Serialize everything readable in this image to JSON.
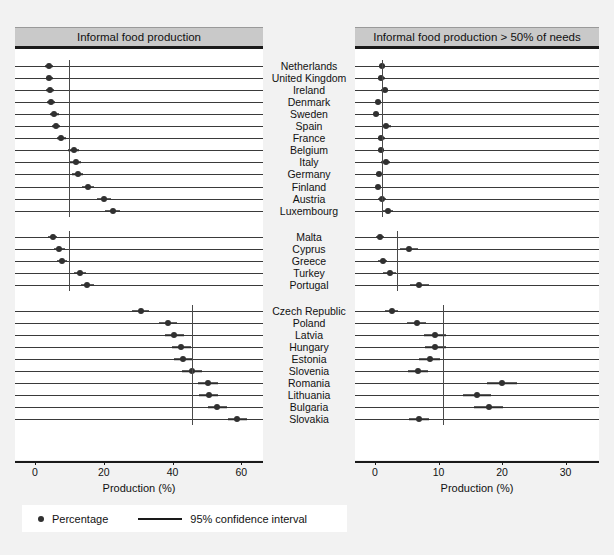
{
  "legend": {
    "percentage_label": "Percentage",
    "ci_label": "95% confidence interval",
    "dot_icon": "filled-circle-marker",
    "line_icon": "horizontal-line-marker"
  },
  "chart_data": {
    "type": "scatter",
    "title": "",
    "panels": [
      {
        "id": "left",
        "header": "Informal food production",
        "xlabel": "Production (%)",
        "xlim": [
          0,
          64
        ],
        "ticks": [
          0,
          20,
          40,
          60
        ],
        "tick_labels": [
          "0",
          "20",
          "40",
          "60"
        ],
        "grid": false,
        "groups": [
          {
            "name": "Western Europe",
            "reference_line": 10.0,
            "points": [
              {
                "label": "Netherlands",
                "value": 4.1,
                "ci_low": 3.0,
                "ci_high": 5.2
              },
              {
                "label": "United Kingdom",
                "value": 4.2,
                "ci_low": 3.1,
                "ci_high": 5.3
              },
              {
                "label": "Ireland",
                "value": 4.4,
                "ci_low": 3.2,
                "ci_high": 5.6
              },
              {
                "label": "Denmark",
                "value": 4.6,
                "ci_low": 3.4,
                "ci_high": 5.8
              },
              {
                "label": "Sweden",
                "value": 5.6,
                "ci_low": 4.3,
                "ci_high": 6.9
              },
              {
                "label": "Spain",
                "value": 6.1,
                "ci_low": 4.8,
                "ci_high": 7.4
              },
              {
                "label": "France",
                "value": 7.6,
                "ci_low": 6.3,
                "ci_high": 8.9
              },
              {
                "label": "Belgium",
                "value": 11.2,
                "ci_low": 9.6,
                "ci_high": 12.8
              },
              {
                "label": "Italy",
                "value": 11.9,
                "ci_low": 10.3,
                "ci_high": 13.5
              },
              {
                "label": "Germany",
                "value": 12.4,
                "ci_low": 10.8,
                "ci_high": 14.0
              },
              {
                "label": "Finland",
                "value": 15.5,
                "ci_low": 13.7,
                "ci_high": 17.3
              },
              {
                "label": "Austria",
                "value": 20.0,
                "ci_low": 18.0,
                "ci_high": 22.0
              },
              {
                "label": "Luxembourg",
                "value": 22.6,
                "ci_low": 20.4,
                "ci_high": 24.8
              }
            ]
          },
          {
            "name": "Southern Europe",
            "reference_line": 10.0,
            "points": [
              {
                "label": "Malta",
                "value": 5.2,
                "ci_low": 3.9,
                "ci_high": 6.5
              },
              {
                "label": "Cyprus",
                "value": 7.1,
                "ci_low": 5.6,
                "ci_high": 8.6
              },
              {
                "label": "Greece",
                "value": 7.8,
                "ci_low": 6.3,
                "ci_high": 9.3
              },
              {
                "label": "Turkey",
                "value": 13.0,
                "ci_low": 11.2,
                "ci_high": 14.8
              },
              {
                "label": "Portugal",
                "value": 15.2,
                "ci_low": 13.3,
                "ci_high": 17.1
              }
            ]
          },
          {
            "name": "Central and Eastern Europe",
            "reference_line": 45.7,
            "points": [
              {
                "label": "Czech Republic",
                "value": 30.7,
                "ci_low": 28.2,
                "ci_high": 33.2
              },
              {
                "label": "Poland",
                "value": 38.6,
                "ci_low": 36.0,
                "ci_high": 41.2
              },
              {
                "label": "Latvia",
                "value": 40.5,
                "ci_low": 37.8,
                "ci_high": 43.2
              },
              {
                "label": "Hungary",
                "value": 42.6,
                "ci_low": 39.8,
                "ci_high": 45.4
              },
              {
                "label": "Estonia",
                "value": 43.1,
                "ci_low": 40.3,
                "ci_high": 45.9
              },
              {
                "label": "Slovenia",
                "value": 45.7,
                "ci_low": 42.8,
                "ci_high": 48.6
              },
              {
                "label": "Romania",
                "value": 50.3,
                "ci_low": 47.5,
                "ci_high": 53.1
              },
              {
                "label": "Lithuania",
                "value": 50.5,
                "ci_low": 47.7,
                "ci_high": 53.3
              },
              {
                "label": "Bulgaria",
                "value": 53.0,
                "ci_low": 50.2,
                "ci_high": 55.8
              },
              {
                "label": "Slovakia",
                "value": 58.9,
                "ci_low": 56.1,
                "ci_high": 61.7
              }
            ]
          }
        ]
      },
      {
        "id": "right",
        "header": "Informal food production > 50% of needs",
        "xlabel": "Production (%)",
        "xlim": [
          0,
          34
        ],
        "ticks": [
          0,
          10,
          20,
          30
        ],
        "tick_labels": [
          "0",
          "10",
          "20",
          "30"
        ],
        "grid": false,
        "groups": [
          {
            "name": "Western Europe",
            "reference_line": 1.1,
            "points": [
              {
                "label": "Netherlands",
                "value": 1.1,
                "ci_low": 0.6,
                "ci_high": 1.6
              },
              {
                "label": "United Kingdom",
                "value": 1.0,
                "ci_low": 0.5,
                "ci_high": 1.5
              },
              {
                "label": "Ireland",
                "value": 1.5,
                "ci_low": 0.9,
                "ci_high": 2.1
              },
              {
                "label": "Denmark",
                "value": 0.5,
                "ci_low": 0.1,
                "ci_high": 0.9
              },
              {
                "label": "Sweden",
                "value": 0.2,
                "ci_low": 0.0,
                "ci_high": 0.6
              },
              {
                "label": "Spain",
                "value": 1.8,
                "ci_low": 1.1,
                "ci_high": 2.5
              },
              {
                "label": "France",
                "value": 1.0,
                "ci_low": 0.5,
                "ci_high": 1.5
              },
              {
                "label": "Belgium",
                "value": 0.9,
                "ci_low": 0.4,
                "ci_high": 1.4
              },
              {
                "label": "Italy",
                "value": 1.7,
                "ci_low": 1.0,
                "ci_high": 2.4
              },
              {
                "label": "Germany",
                "value": 0.6,
                "ci_low": 0.2,
                "ci_high": 1.0
              },
              {
                "label": "Finland",
                "value": 0.5,
                "ci_low": 0.1,
                "ci_high": 0.9
              },
              {
                "label": "Austria",
                "value": 1.1,
                "ci_low": 0.5,
                "ci_high": 1.7
              },
              {
                "label": "Luxembourg",
                "value": 2.0,
                "ci_low": 1.2,
                "ci_high": 2.8
              }
            ]
          },
          {
            "name": "Southern Europe",
            "reference_line": 3.5,
            "points": [
              {
                "label": "Malta",
                "value": 0.8,
                "ci_low": 0.2,
                "ci_high": 1.4
              },
              {
                "label": "Cyprus",
                "value": 5.3,
                "ci_low": 3.9,
                "ci_high": 6.7
              },
              {
                "label": "Greece",
                "value": 1.2,
                "ci_low": 0.5,
                "ci_high": 1.9
              },
              {
                "label": "Turkey",
                "value": 2.3,
                "ci_low": 1.3,
                "ci_high": 3.3
              },
              {
                "label": "Portugal",
                "value": 7.0,
                "ci_low": 5.5,
                "ci_high": 8.5
              }
            ]
          },
          {
            "name": "Central and Eastern Europe",
            "reference_line": 10.7,
            "points": [
              {
                "label": "Czech Republic",
                "value": 2.6,
                "ci_low": 1.5,
                "ci_high": 3.7
              },
              {
                "label": "Poland",
                "value": 6.6,
                "ci_low": 5.1,
                "ci_high": 8.1
              },
              {
                "label": "Latvia",
                "value": 9.4,
                "ci_low": 7.7,
                "ci_high": 11.1
              },
              {
                "label": "Hungary",
                "value": 9.5,
                "ci_low": 7.8,
                "ci_high": 11.2
              },
              {
                "label": "Estonia",
                "value": 8.6,
                "ci_low": 6.9,
                "ci_high": 10.3
              },
              {
                "label": "Slovenia",
                "value": 6.8,
                "ci_low": 5.2,
                "ci_high": 8.4
              },
              {
                "label": "Romania",
                "value": 20.0,
                "ci_low": 17.6,
                "ci_high": 22.4
              },
              {
                "label": "Lithuania",
                "value": 16.0,
                "ci_low": 13.8,
                "ci_high": 18.2
              },
              {
                "label": "Bulgaria",
                "value": 17.9,
                "ci_low": 15.6,
                "ci_high": 20.2
              },
              {
                "label": "Slovakia",
                "value": 6.9,
                "ci_low": 5.3,
                "ci_high": 8.5
              }
            ]
          }
        ]
      }
    ],
    "row_labels": [
      "Netherlands",
      "United Kingdom",
      "Ireland",
      "Denmark",
      "Sweden",
      "Spain",
      "France",
      "Belgium",
      "Italy",
      "Germany",
      "Finland",
      "Austria",
      "Luxembourg",
      "Malta",
      "Cyprus",
      "Greece",
      "Turkey",
      "Portugal",
      "Czech Republic",
      "Poland",
      "Latvia",
      "Hungary",
      "Estonia",
      "Slovenia",
      "Romania",
      "Lithuania",
      "Bulgaria",
      "Slovakia"
    ]
  }
}
